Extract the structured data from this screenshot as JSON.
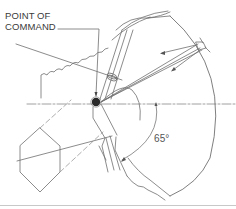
{
  "diagram": {
    "labels": {
      "point_of_command_line1": "POINT OF",
      "point_of_command_line2": "COMMAND",
      "angle": "65°"
    },
    "elements": {
      "pivot": "point-of-command-dot",
      "sector_arc": "outer-sector-boundary",
      "angle_arc": "65-degree-angle-arc",
      "centerline": "horizontal-dash-dot-centerline",
      "left_object": "hexagonal-shape",
      "top_left_object": "rough-edged-block"
    },
    "colors": {
      "line": "#6e6e6e",
      "dark_line": "#444444",
      "pivot": "#2a2a2a",
      "text": "#3a3a3a",
      "rule": "#c8c8c8",
      "background": "#ffffff"
    }
  }
}
